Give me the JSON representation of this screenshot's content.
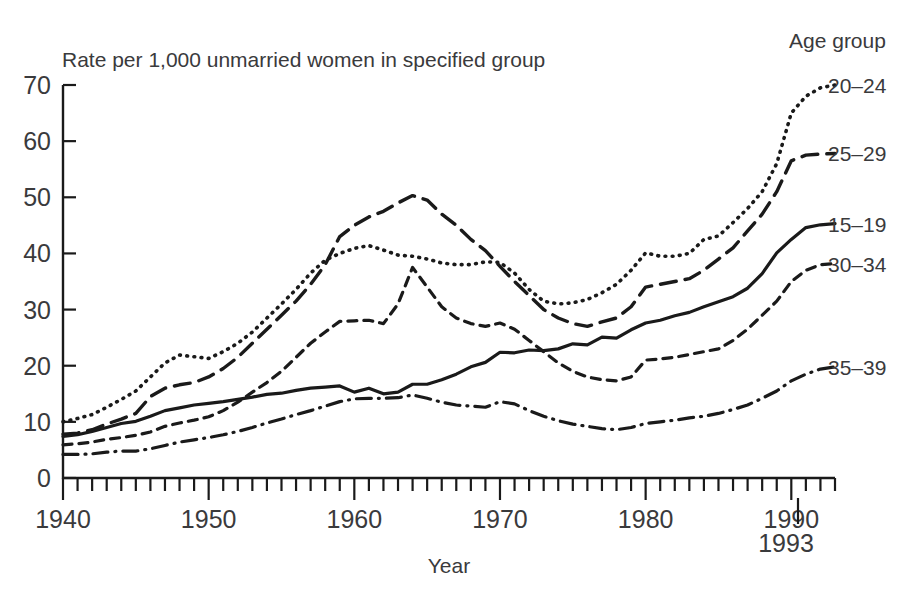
{
  "chart_data": {
    "type": "line",
    "title": "",
    "subtitle": "",
    "ylabel": "Rate per 1,000 unmarried women in specified group",
    "xlabel": "Year",
    "xlim": [
      1940,
      1993
    ],
    "ylim": [
      0,
      70
    ],
    "grid": false,
    "legend_position": "right",
    "legend_heading": "Age group",
    "x_ticks_major": [
      1940,
      1950,
      1960,
      1970,
      1980,
      1990
    ],
    "x_tick_labels": [
      "1940",
      "1950",
      "1960",
      "1970",
      "1980",
      "1990"
    ],
    "x_end_marker_label": "1993",
    "x_minor_tick_step": 1,
    "y_ticks": [
      0,
      10,
      20,
      30,
      40,
      50,
      60,
      70
    ],
    "y_tick_labels": [
      "0",
      "10",
      "20",
      "30",
      "40",
      "50",
      "60",
      "70"
    ],
    "x": [
      1940,
      1941,
      1942,
      1943,
      1944,
      1945,
      1946,
      1947,
      1948,
      1949,
      1950,
      1951,
      1952,
      1953,
      1954,
      1955,
      1956,
      1957,
      1958,
      1959,
      1960,
      1961,
      1962,
      1963,
      1964,
      1965,
      1966,
      1967,
      1968,
      1969,
      1970,
      1971,
      1972,
      1973,
      1974,
      1975,
      1976,
      1977,
      1978,
      1979,
      1980,
      1981,
      1982,
      1983,
      1984,
      1985,
      1986,
      1987,
      1988,
      1989,
      1990,
      1991,
      1992,
      1993
    ],
    "series": [
      {
        "name": "20–24",
        "label": "20–24",
        "line_style": "dotted",
        "color": "#1a1a1a",
        "values": [
          10.0,
          10.6,
          11.3,
          12.6,
          14.0,
          15.5,
          18.0,
          20.5,
          21.9,
          21.6,
          21.3,
          22.5,
          24.0,
          26.0,
          28.5,
          31.0,
          33.6,
          36.5,
          38.8,
          40.0,
          40.9,
          41.4,
          40.6,
          39.7,
          39.5,
          39.0,
          38.3,
          38.0,
          38.0,
          38.5,
          38.4,
          36.5,
          33.6,
          31.5,
          31.0,
          31.2,
          31.8,
          33.0,
          34.5,
          37.0,
          40.1,
          39.5,
          39.5,
          40.0,
          42.5,
          43.1,
          45.5,
          48.0,
          51.0,
          56.0,
          65.0,
          68.0,
          69.5,
          70.0
        ]
      },
      {
        "name": "25–29",
        "label": "25–29",
        "line_style": "long-dash",
        "color": "#1a1a1a",
        "values": [
          7.8,
          8.0,
          8.6,
          9.6,
          10.5,
          11.5,
          14.5,
          16.0,
          16.6,
          17.0,
          18.0,
          19.5,
          21.5,
          24.0,
          26.5,
          29.0,
          31.5,
          34.5,
          38.0,
          43.0,
          45.0,
          46.5,
          47.5,
          49.0,
          50.3,
          49.5,
          47.0,
          45.0,
          42.5,
          40.5,
          37.7,
          35.0,
          32.5,
          30.0,
          28.5,
          27.5,
          27.0,
          27.8,
          28.5,
          30.5,
          34.0,
          34.5,
          35.0,
          35.5,
          37.0,
          39.0,
          41.0,
          44.0,
          47.0,
          51.0,
          56.5,
          57.5,
          57.7,
          57.8
        ]
      },
      {
        "name": "15–19",
        "label": "15–19",
        "line_style": "solid",
        "color": "#1a1a1a",
        "values": [
          7.4,
          7.7,
          8.3,
          9.0,
          9.7,
          10.1,
          11.0,
          12.0,
          12.5,
          13.0,
          13.3,
          13.6,
          14.0,
          14.4,
          14.9,
          15.1,
          15.6,
          16.0,
          16.2,
          16.4,
          15.3,
          16.0,
          15.0,
          15.3,
          16.7,
          16.7,
          17.5,
          18.5,
          19.8,
          20.6,
          22.4,
          22.3,
          22.8,
          22.7,
          23.0,
          23.9,
          23.7,
          25.1,
          24.9,
          26.4,
          27.6,
          28.1,
          28.9,
          29.5,
          30.5,
          31.4,
          32.3,
          33.8,
          36.4,
          40.1,
          42.5,
          44.6,
          45.1,
          45.3
        ]
      },
      {
        "name": "30–34",
        "label": "30–34",
        "line_style": "short-dash",
        "color": "#1a1a1a",
        "values": [
          5.9,
          6.1,
          6.4,
          6.9,
          7.2,
          7.6,
          8.2,
          9.2,
          9.8,
          10.3,
          10.9,
          12.0,
          13.5,
          15.3,
          17.0,
          19.0,
          21.5,
          24.0,
          26.0,
          27.9,
          28.0,
          28.1,
          27.5,
          31.0,
          37.5,
          34.0,
          30.5,
          28.5,
          27.5,
          27.0,
          27.6,
          26.5,
          24.5,
          22.5,
          20.5,
          19.0,
          18.0,
          17.5,
          17.3,
          18.0,
          21.0,
          21.2,
          21.5,
          22.0,
          22.5,
          23.0,
          24.5,
          26.5,
          29.0,
          31.5,
          35.0,
          37.0,
          38.0,
          38.2
        ]
      },
      {
        "name": "35–39",
        "label": "35–39",
        "line_style": "dash-dot",
        "color": "#1a1a1a",
        "values": [
          4.2,
          4.2,
          4.3,
          4.6,
          4.8,
          4.8,
          5.2,
          5.8,
          6.4,
          6.8,
          7.2,
          7.7,
          8.3,
          9.0,
          9.8,
          10.5,
          11.3,
          12.0,
          12.8,
          13.6,
          14.1,
          14.2,
          14.2,
          14.3,
          14.8,
          14.2,
          13.5,
          13.0,
          12.8,
          12.6,
          13.6,
          13.2,
          12.0,
          11.0,
          10.2,
          9.6,
          9.2,
          8.8,
          8.6,
          9.0,
          9.7,
          10.0,
          10.3,
          10.7,
          11.0,
          11.5,
          12.2,
          13.0,
          14.2,
          15.5,
          17.3,
          18.5,
          19.4,
          19.8
        ]
      }
    ]
  },
  "axis": {
    "y_axis_title": "Rate per 1,000 unmarried women in specified group",
    "x_axis_title": "Year",
    "end_year_marker": "1993"
  },
  "legend": {
    "heading": "Age group",
    "entries": [
      {
        "label": "20–24",
        "style": "dotted"
      },
      {
        "label": "25–29",
        "style": "long-dash"
      },
      {
        "label": "15–19",
        "style": "solid"
      },
      {
        "label": "30–34",
        "style": "short-dash"
      },
      {
        "label": "35–39",
        "style": "dash-dot"
      }
    ]
  }
}
